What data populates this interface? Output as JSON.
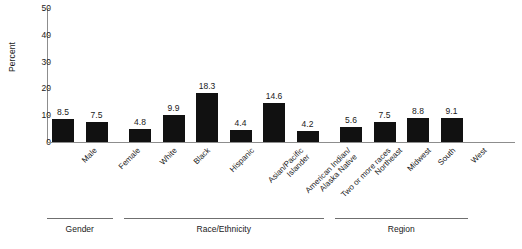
{
  "chart_data": {
    "type": "bar",
    "title": "",
    "subtitle": "",
    "xlabel": "",
    "ylabel": "Percent",
    "ylim": [
      0,
      50
    ],
    "yticks": [
      0,
      10,
      20,
      30,
      40,
      50
    ],
    "grid": false,
    "legend": null,
    "bar_color": "#111111",
    "axis_color": "#8d8d8d",
    "categories": [
      "Male",
      "Female",
      "White",
      "Black",
      "Hispanic",
      "Asian/Pacific Islander",
      "American Indian/Alaska Native",
      "Two or more races",
      "Northeast",
      "Midwest",
      "South",
      "West"
    ],
    "category_lines": [
      [
        "Male"
      ],
      [
        "Female"
      ],
      [
        "White"
      ],
      [
        "Black"
      ],
      [
        "Hispanic"
      ],
      [
        "Asian/Pacific",
        "Islander"
      ],
      [
        "American Indian/",
        "Alaska Native"
      ],
      [
        "Two or more races"
      ],
      [
        "Northeast"
      ],
      [
        "Midwest"
      ],
      [
        "South"
      ],
      [
        "West"
      ]
    ],
    "values": [
      8.5,
      7.5,
      4.8,
      9.9,
      18.3,
      4.4,
      14.6,
      4.2,
      5.6,
      7.5,
      8.8,
      9.1
    ],
    "value_labels": [
      "8.5",
      "7.5",
      "4.8",
      "9.9",
      "18.3",
      "4.4",
      "14.6",
      "4.2",
      "5.6",
      "7.5",
      "8.8",
      "9.1"
    ],
    "groups": [
      {
        "label": "Gender",
        "start": 0,
        "end": 1
      },
      {
        "label": "Race/Ethnicity",
        "start": 2,
        "end": 7
      },
      {
        "label": "Region",
        "start": 8,
        "end": 11
      }
    ]
  }
}
